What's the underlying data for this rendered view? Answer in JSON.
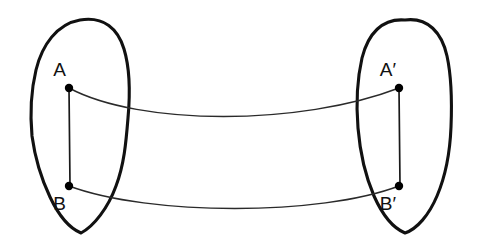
{
  "figure": {
    "type": "geometry-diagram",
    "title": "",
    "background_color": "#ffffff",
    "ink_color": "#111111",
    "width": 478,
    "height": 246
  },
  "regions": [
    {
      "id": "left-region",
      "name": "left-blob",
      "label": "",
      "outline": "M 80,20 C 104,16 118,29 124,49 C 131,72 130,96 128,118 C 126,143 124,165 116,186 C 108,208 94,226 81,233 C 69,228 58,214 50,197 C 41,178 35,158 32,136 C 30,114 31,91 36,70 C 42,45 57,24 80,20 Z"
    },
    {
      "id": "right-region",
      "name": "right-blob",
      "label": "",
      "outline": "M 405,20 C 428,17 442,33 447,56 C 452,79 452,103 451,127 C 450,152 446,175 437,196 C 429,215 417,229 405,233 C 393,228 382,214 374,196 C 365,175 360,152 358,128 C 356,104 357,80 362,58 C 368,34 382,18 405,20 Z"
    }
  ],
  "points": [
    {
      "id": "A",
      "label": "A",
      "x": 69,
      "y": 88,
      "label_x": 66,
      "label_y": 76,
      "anchor": "end",
      "region": "left-region"
    },
    {
      "id": "B",
      "label": "B",
      "x": 69,
      "y": 186,
      "label_x": 66,
      "label_y": 210,
      "anchor": "end",
      "region": "left-region"
    },
    {
      "id": "Ap",
      "label": "A′",
      "x": 399,
      "y": 88,
      "label_x": 396,
      "label_y": 76,
      "anchor": "end",
      "region": "right-region"
    },
    {
      "id": "Bp",
      "label": "B′",
      "x": 399,
      "y": 186,
      "label_x": 396,
      "label_y": 210,
      "anchor": "end",
      "region": "right-region"
    }
  ],
  "segments": [
    {
      "id": "seg-AB",
      "name": "segment-A-B",
      "from": "A",
      "to": "B",
      "path": "M 69,88 L 70,186"
    },
    {
      "id": "seg-ApBp",
      "name": "segment-Ap-Bp",
      "from": "Ap",
      "to": "Bp",
      "path": "M 399,88 L 400,186"
    }
  ],
  "mapping_curves": [
    {
      "id": "curve-A-Ap",
      "name": "mapping-curve-A-to-Aprime",
      "from": "A",
      "to": "Ap",
      "path": "M 69,88 C 140,126 300,126 399,88"
    },
    {
      "id": "curve-B-Bp",
      "name": "mapping-curve-B-to-Bprime",
      "from": "B",
      "to": "Bp",
      "path": "M 69,186 C 150,216 320,216 399,186"
    }
  ]
}
